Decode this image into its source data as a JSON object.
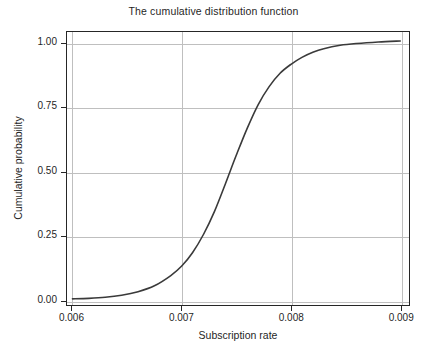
{
  "chart_data": {
    "type": "line",
    "title": "The cumulative distribution function",
    "xlabel": "Subscription rate",
    "ylabel": "Cumulative probability",
    "xlim": [
      0.00595,
      0.00908
    ],
    "ylim": [
      -0.02,
      1.045
    ],
    "grid": true,
    "legend": null,
    "legend_position": "none",
    "xticks": [
      0.006,
      0.007,
      0.008,
      0.009
    ],
    "xticklabels": [
      "0.006",
      "0.007",
      "0.008",
      "0.009"
    ],
    "yticks": [
      0.0,
      0.25,
      0.5,
      0.75,
      1.0
    ],
    "yticklabels": [
      "0.00",
      "0.25",
      "0.50",
      "0.75",
      "1.00"
    ],
    "line_color": "#3a3a3a",
    "line_width": 1.6,
    "series": [
      {
        "name": "Cumulative distribution function",
        "x": [
          0.006,
          0.00615,
          0.0063,
          0.00645,
          0.0066,
          0.00675,
          0.0069,
          0.007,
          0.0071,
          0.0072,
          0.0073,
          0.0074,
          0.00743,
          0.0075,
          0.0076,
          0.0077,
          0.0078,
          0.0079,
          0.008,
          0.0081,
          0.0082,
          0.0083,
          0.00845,
          0.0086,
          0.0088,
          0.009
        ],
        "y": [
          0.004,
          0.006,
          0.01,
          0.018,
          0.032,
          0.055,
          0.095,
          0.132,
          0.185,
          0.256,
          0.345,
          0.453,
          0.487,
          0.565,
          0.67,
          0.762,
          0.832,
          0.884,
          0.919,
          0.946,
          0.966,
          0.98,
          0.993,
          1.0,
          1.006,
          1.01
        ]
      }
    ]
  },
  "axes": {
    "title": "The cumulative distribution function",
    "xlabel": "Subscription rate",
    "ylabel": "Cumulative probability"
  }
}
